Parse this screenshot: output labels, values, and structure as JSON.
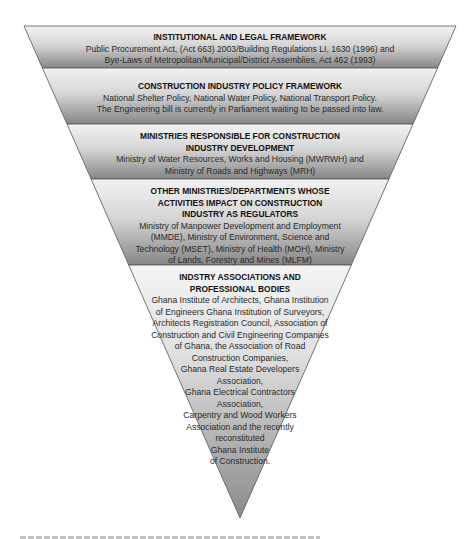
{
  "diagram": {
    "type": "inverted-pyramid",
    "colors": {
      "band_light": "#ededed",
      "band_dark": "#8c8c8c",
      "border": "#444444",
      "text": "#1a1a1a"
    },
    "levels": [
      {
        "title": "INSTITUTIONAL AND LEGAL FRAMEWORK",
        "lines": [
          "Public Procurement Act, (Act 663) 2003/Building Regulations LI, 1630 (1996) and",
          "Bye-Laws of Metropolitan/Municipal/District Assemblies, Act 462 (1993)"
        ]
      },
      {
        "title": "CONSTRUCTION INDUSTRY POLICY FRAMEWORK",
        "lines": [
          "National Shelter Policy, National Water Policy, National Transport Policy.",
          "The Engineering bill is currently in Parliament waiting to be passed into law."
        ]
      },
      {
        "title_lines": [
          "MINISTRIES RESPONSIBLE FOR CONSTRUCTION",
          "INDUSTRY DEVELOPMENT"
        ],
        "lines": [
          "Ministry of Water Resources, Works and Housing (MWRWH) and",
          "Ministry of Roads and Highways (MRH)"
        ]
      },
      {
        "title_lines": [
          "OTHER MINISTRIES/DEPARTMENTS WHOSE",
          "ACTIVITIES IMPACT ON CONSTRUCTION",
          "INDUSTRY AS REGULATORS"
        ],
        "lines": [
          "Ministry of Manpower Development and Employment",
          "(MMDE), Ministry of Environment, Science and",
          "Technology (MSET), Ministry of Health (MOH), Ministry",
          "of Lands, Forestry and Mines (MLFM)"
        ]
      },
      {
        "title_lines": [
          "INDSTRY ASSOCIATIONS AND",
          "PROFESSIONAL BODIES"
        ],
        "lines": [
          "Ghana Institute of Architects, Ghana Institution",
          "of Engineers Ghana Institution of Surveyors,",
          "Architects Registration Council, Association of",
          "Construction and Civil Engineering Companies",
          "of Ghana, the Association of Road",
          "Construction Companies,",
          "Ghana Real Estate Developers",
          "Association,",
          "Ghana Electrical Contractors",
          "Association,",
          "Carpentry and Wood Workers",
          "Association and the recently",
          "reconstituted",
          "Ghana Institute",
          "of Construction."
        ]
      }
    ]
  }
}
